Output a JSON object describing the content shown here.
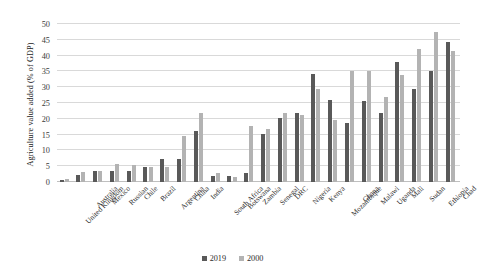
{
  "chart_data": {
    "type": "bar",
    "title": "",
    "xlabel": "",
    "ylabel": "Agriculture value added (% of GDP)",
    "ylim": [
      0,
      50
    ],
    "yticks": [
      0,
      5,
      10,
      15,
      20,
      25,
      30,
      35,
      40,
      45,
      50
    ],
    "grid": true,
    "legend_position": "bottom",
    "categories": [
      "United Kingdom",
      "Australia",
      "Mexico",
      "Russian",
      "Chile",
      "Brazil",
      "Argentina",
      "China",
      "India",
      "South Africa",
      "Botswana",
      "Zambia",
      "Senegal",
      "DRC",
      "Nigeria",
      "Kenya",
      "Mozambique",
      "Ghana",
      "Malawi",
      "Uganda",
      "Mali",
      "Sudan",
      "Ethiopia",
      "Chad"
    ],
    "series": [
      {
        "name": "2019",
        "color": "#595959",
        "values": [
          0.6,
          2.2,
          3.5,
          3.5,
          3.6,
          4.8,
          7.4,
          7.3,
          16.1,
          1.9,
          1.9,
          2.8,
          15.3,
          20.3,
          21.9,
          34.2,
          26.0,
          18.7,
          25.5,
          21.9,
          38.0,
          29.5,
          35.0,
          44.2
        ],
        "unit": "% of GDP"
      },
      {
        "name": "2000",
        "color": "#b3b3b3",
        "values": [
          0.9,
          3.1,
          3.4,
          5.8,
          5.5,
          4.9,
          4.9,
          14.7,
          21.9,
          2.8,
          1.7,
          17.7,
          16.8,
          21.9,
          21.2,
          29.5,
          19.5,
          35.0,
          35.0,
          27.0,
          34.0,
          42.2,
          47.5,
          41.5
        ],
        "unit": "% of GDP"
      }
    ]
  },
  "legend": {
    "items": [
      {
        "label": "2019",
        "color": "#595959"
      },
      {
        "label": "2000",
        "color": "#b3b3b3"
      }
    ]
  }
}
